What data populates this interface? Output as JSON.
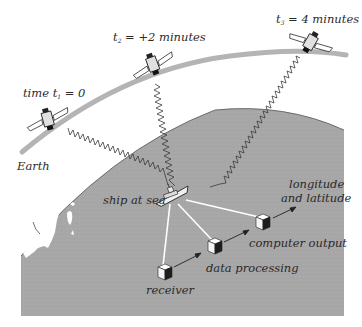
{
  "diagram": {
    "type": "GPS satellite positioning illustration",
    "colors": {
      "background": "#ffffff",
      "earth_fill": "#a7a7a7",
      "orbit_band": "#b4b4b4",
      "land": "#ffffff",
      "signal_line": "#3a3a3a",
      "data_link": "#ffffff",
      "text": "#2a2a2a"
    },
    "satellites": [
      {
        "id": "sat-1",
        "label_prefix": "time ",
        "var": "t",
        "sub": "1",
        "eq": " = 0",
        "x": 48,
        "y": 120
      },
      {
        "id": "sat-2",
        "label_prefix": "",
        "var": "t",
        "sub": "2",
        "eq": " = +2 minutes",
        "x": 153,
        "y": 65
      },
      {
        "id": "sat-3",
        "label_prefix": "",
        "var": "t",
        "sub": "3",
        "eq": " = 4 minutes",
        "x": 310,
        "y": 42
      }
    ],
    "labels": {
      "earth": "Earth",
      "ship": "ship at sea",
      "receiver": "receiver",
      "data_processing": "data processing",
      "computer_output": "computer output",
      "output_line1": "longitude",
      "output_line2": "and latitude"
    },
    "nodes": [
      {
        "id": "receiver",
        "x": 165,
        "y": 272
      },
      {
        "id": "data-processing",
        "x": 215,
        "y": 246
      },
      {
        "id": "computer-output",
        "x": 263,
        "y": 222
      }
    ],
    "ship": {
      "x": 172,
      "y": 195
    }
  }
}
